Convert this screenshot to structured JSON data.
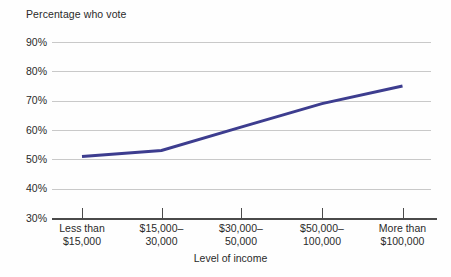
{
  "chart_data": {
    "type": "line",
    "title": "",
    "ylabel": "Percentage who vote",
    "xlabel": "Level of income",
    "categories": [
      "Less than\n$15,000",
      "$15,000–\n30,000",
      "$30,000–\n50,000",
      "$50,000–\n100,000",
      "More than\n$100,000"
    ],
    "category_lines": [
      [
        "Less than",
        "$15,000"
      ],
      [
        "$15,000–",
        "30,000"
      ],
      [
        "$30,000–",
        "50,000"
      ],
      [
        "$50,000–",
        "100,000"
      ],
      [
        "More than",
        "$100,000"
      ]
    ],
    "values": [
      51,
      53,
      61,
      69,
      75
    ],
    "ylim": [
      30,
      90
    ],
    "ytick_values": [
      90,
      80,
      70,
      60,
      50,
      40,
      30
    ],
    "ytick_labels": [
      "90%",
      "80%",
      "70%",
      "60%",
      "50%",
      "40%",
      "30%"
    ],
    "grid": true,
    "legend": "none",
    "series_color": "#3d3d8f",
    "gridline_color": "#c9c9c9",
    "axis_color": "#4a4a4a",
    "background_color": "#fefefe",
    "line_width": 3
  }
}
